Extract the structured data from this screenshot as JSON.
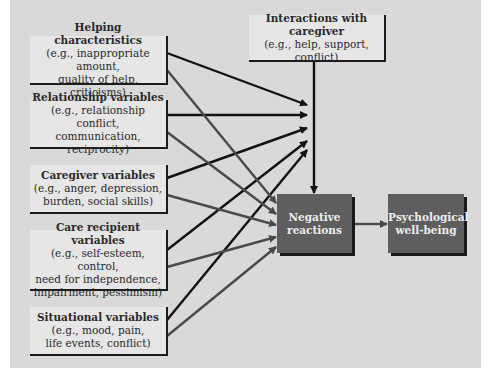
{
  "diagram": {
    "colors": {
      "background": "#d9d9d9",
      "box_fill": "#e6e6e6",
      "dark_box": "#5e5e5e",
      "black_line": "#111111",
      "gray_line": "#4a4a4a"
    },
    "top_box": {
      "title": "Interactions with caregiver",
      "detail": "(e.g., help, support, conflict)"
    },
    "left_boxes": [
      {
        "title": "Helping characteristics",
        "lines": [
          "(e.g., inappropriate amount,",
          "quality of help, criticisms)"
        ]
      },
      {
        "title": "Relationship variables",
        "lines": [
          "(e.g., relationship conflict,",
          "communication, reciprocity)"
        ]
      },
      {
        "title": "Caregiver variables",
        "lines": [
          "(e.g., anger, depression,",
          "burden, social skills)"
        ]
      },
      {
        "title": "Care recipient variables",
        "lines": [
          "(e.g., self-esteem, control,",
          "need for independence,",
          "impairment, pessimism)"
        ]
      },
      {
        "title": "Situational variables",
        "lines": [
          "(e.g., mood, pain,",
          "life events, conflict)"
        ]
      }
    ],
    "negative_box": {
      "line1": "Negative",
      "line2": "reactions"
    },
    "outcome_box": {
      "line1": "Psychological",
      "line2": "well-being"
    }
  }
}
